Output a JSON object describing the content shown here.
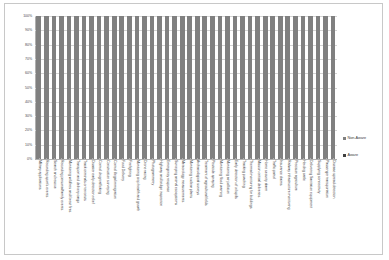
{
  "chart_data": {
    "type": "bar",
    "subtype": "100% stacked column",
    "title": "",
    "xlabel": "",
    "ylabel": "",
    "ylim": [
      0,
      100
    ],
    "ytick_labels": [
      "100%",
      "90%",
      "80%",
      "70%",
      "60%",
      "50%",
      "40%",
      "30%",
      "20%",
      "10%",
      "0%"
    ],
    "ytick_values": [
      100,
      90,
      80,
      70,
      60,
      50,
      40,
      30,
      20,
      10,
      0
    ],
    "grid": true,
    "legend_position": "right",
    "categories": [
      "Military applications",
      "Recording sport's events",
      "Search and rescue",
      "Recording personal/family events",
      "Monitoring wildfires and forest fires",
      "Transport and delivery cargo",
      "Track criminals or terrorists",
      "Disaster early detection relief",
      "Control drug trafficking",
      "Construction surveying",
      "Control illegal immigration",
      "Food Delivery",
      "Firefighting",
      "Monitoring crop health and growth",
      "Drone racing",
      "Photogrammetry",
      "Highway and bridge inspection",
      "Emergency response",
      "Surveying animal ecosystems",
      "Meteorology measurements",
      "Monitoring nuclear plants",
      "Archaeological surveys",
      "Treatment of agricultural fields",
      "Pesticide spraying",
      "Monitoring flood warning",
      "Monitoring air pollution",
      "Early detection of oil spills",
      "Tracking poaching",
      "Thermal monitoring for buildings",
      "Mission critical deliveries",
      "Home security alarm",
      "Traffic patrol",
      "Insurance claims",
      "Railway infrastructure monitoring",
      "Precision agriculture",
      "Herding cattle",
      "Delivering Sanitation equipment",
      "Supplying connectivity",
      "Passenger transportation",
      "Disease spread detection"
    ],
    "series": [
      {
        "name": "Non-Aware",
        "color": "#808080",
        "values": [
          100,
          100,
          100,
          100,
          100,
          100,
          100,
          100,
          100,
          100,
          100,
          100,
          100,
          100,
          100,
          100,
          100,
          100,
          100,
          100,
          100,
          100,
          100,
          100,
          100,
          100,
          100,
          100,
          100,
          100,
          100,
          100,
          100,
          100,
          100,
          100,
          100,
          100,
          100,
          100
        ]
      },
      {
        "name": "Aware",
        "color": "#404040",
        "values": [
          0,
          0,
          0,
          0,
          0,
          0,
          0,
          0,
          0,
          0,
          0,
          0,
          0,
          0,
          0,
          0,
          0,
          0,
          0,
          0,
          0,
          0,
          0,
          0,
          0,
          0,
          0,
          0,
          0,
          0,
          0,
          0,
          0,
          0,
          0,
          0,
          0,
          0,
          0,
          0
        ]
      }
    ]
  },
  "legend": {
    "items": [
      {
        "label": "Non-Aware",
        "marker": "legend-swatch-nonaware"
      },
      {
        "label": "Aware",
        "marker": "legend-swatch-aware"
      }
    ]
  }
}
